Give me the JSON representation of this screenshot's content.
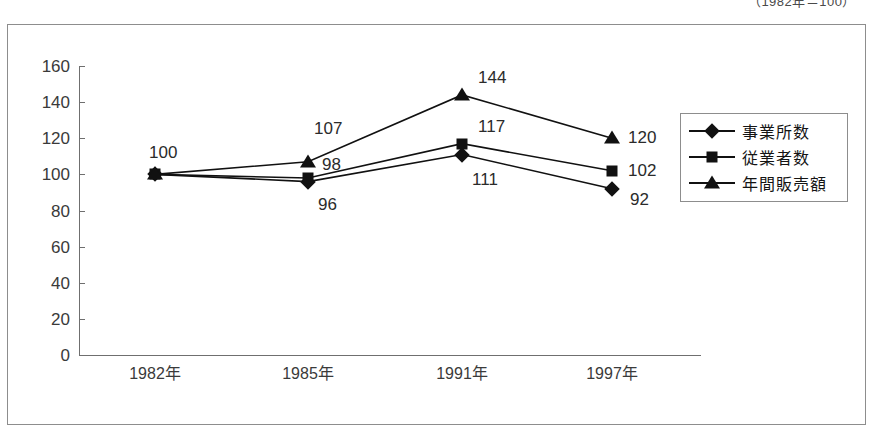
{
  "caption": "（1982年＝100）",
  "chart_data": {
    "type": "line",
    "title": "",
    "subtitle": "",
    "xlabel": "",
    "ylabel": "",
    "categories": [
      "1982年",
      "1985年",
      "1991年",
      "1997年"
    ],
    "ylim": [
      0,
      160
    ],
    "yticks": [
      "0",
      "20",
      "40",
      "60",
      "80",
      "100",
      "120",
      "140",
      "160"
    ],
    "grid": false,
    "legend_position": "right",
    "index_base_note": "（1982年＝100）",
    "series": [
      {
        "name": "事業所数",
        "marker": "diamond",
        "color": "#111111",
        "values": [
          100,
          96,
          111,
          92
        ]
      },
      {
        "name": "従業者数",
        "marker": "square",
        "color": "#111111",
        "values": [
          100,
          98,
          117,
          102
        ]
      },
      {
        "name": "年間販売額",
        "marker": "triangle",
        "color": "#111111",
        "values": [
          100,
          107,
          144,
          120
        ]
      }
    ],
    "point_labels": [
      {
        "text": "100",
        "series": "all",
        "category": "1982年"
      },
      {
        "text": "107",
        "series": "年間販売額",
        "category": "1985年"
      },
      {
        "text": "98",
        "series": "従業者数",
        "category": "1985年"
      },
      {
        "text": "96",
        "series": "事業所数",
        "category": "1985年"
      },
      {
        "text": "144",
        "series": "年間販売額",
        "category": "1991年"
      },
      {
        "text": "117",
        "series": "従業者数",
        "category": "1991年"
      },
      {
        "text": "111",
        "series": "事業所数",
        "category": "1991年"
      },
      {
        "text": "120",
        "series": "年間販売額",
        "category": "1997年"
      },
      {
        "text": "102",
        "series": "従業者数",
        "category": "1997年"
      },
      {
        "text": "92",
        "series": "事業所数",
        "category": "1997年"
      }
    ]
  }
}
